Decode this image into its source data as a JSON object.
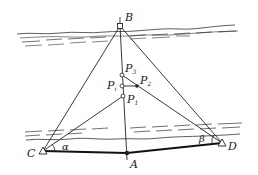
{
  "diagram": {
    "type": "surveying-triangulation-across-river",
    "colors": {
      "ink": "#222222",
      "background": "#ffffff"
    },
    "points": {
      "B": {
        "label": "B",
        "x": 120,
        "y": 26
      },
      "C": {
        "label": "C",
        "x": 43,
        "y": 151
      },
      "A": {
        "label": "A",
        "x": 127,
        "y": 153
      },
      "D": {
        "label": "D",
        "x": 222,
        "y": 143
      },
      "P3": {
        "label": "P",
        "sub": "3",
        "x": 122,
        "y": 75
      },
      "Pi": {
        "label": "P",
        "sub": "i",
        "x": 122,
        "y": 86
      },
      "P2": {
        "label": "P",
        "sub": "2",
        "x": 137,
        "y": 86
      },
      "P1": {
        "label": "P",
        "sub": "1",
        "x": 123,
        "y": 96
      }
    },
    "angles": {
      "alpha": {
        "label": "α",
        "vertex": "C"
      },
      "beta": {
        "label": "β",
        "vertex": "D"
      }
    },
    "labels": {
      "B": "B",
      "C": "C",
      "A": "A",
      "D": "D",
      "P": "P",
      "sub3": "3",
      "subi": "i",
      "sub2": "2",
      "sub1": "1",
      "alpha": "α",
      "beta": "β"
    }
  }
}
